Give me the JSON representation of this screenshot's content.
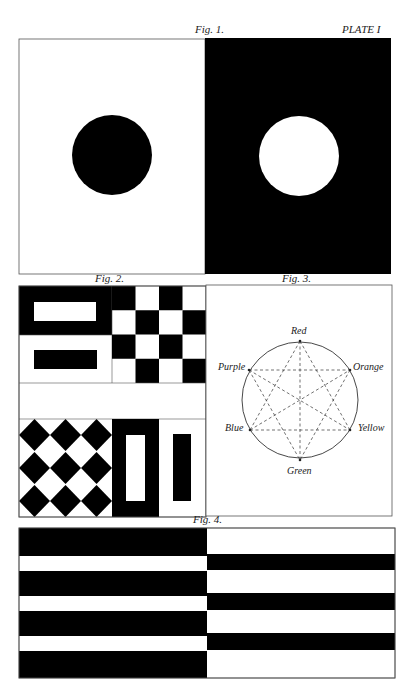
{
  "plate": {
    "title": "PLATE I",
    "colors": {
      "ink": "#000000",
      "paper": "#ffffff",
      "frame": "#555555",
      "dash": "#333333"
    }
  },
  "figures": [
    {
      "id": "fig1",
      "caption": "Fig. 1.",
      "description": "Black disc on white field beside white disc on black field",
      "panels": [
        {
          "background": "white",
          "disc": "black"
        },
        {
          "background": "black",
          "disc": "white"
        }
      ]
    },
    {
      "id": "fig2",
      "caption": "Fig. 2.",
      "description": "Figure-ground reversals: bars, checkerboard, diamonds, vertical bars",
      "panels": [
        {
          "name": "white-bar-on-black"
        },
        {
          "name": "black-bar-on-white"
        },
        {
          "name": "checkerboard",
          "rows": 4,
          "cols": 4
        },
        {
          "name": "diamond-pattern",
          "rows": 3,
          "cols": 3
        },
        {
          "name": "white-vertical-bar-on-black"
        },
        {
          "name": "black-vertical-bar-on-white"
        }
      ]
    },
    {
      "id": "fig3",
      "caption": "Fig. 3.",
      "description": "Color circle with complementary connections",
      "colors": [
        {
          "name": "Red",
          "position": "top"
        },
        {
          "name": "Orange",
          "position": "upper-right"
        },
        {
          "name": "Yellow",
          "position": "lower-right"
        },
        {
          "name": "Green",
          "position": "bottom"
        },
        {
          "name": "Blue",
          "position": "lower-left"
        },
        {
          "name": "Purple",
          "position": "upper-left"
        }
      ],
      "connections": [
        [
          "Red",
          "Blue"
        ],
        [
          "Red",
          "Yellow"
        ],
        [
          "Red",
          "Green"
        ],
        [
          "Purple",
          "Orange"
        ],
        [
          "Purple",
          "Yellow"
        ],
        [
          "Purple",
          "Green"
        ],
        [
          "Blue",
          "Yellow"
        ],
        [
          "Blue",
          "Orange"
        ],
        [
          "Orange",
          "Green"
        ]
      ]
    },
    {
      "id": "fig4",
      "caption": "Fig. 4.",
      "description": "Horizontal stripes: left wide black bands, right wide white bands",
      "left_bands": [
        "black",
        "white",
        "black",
        "white",
        "black",
        "white",
        "black"
      ],
      "right_bands": [
        "white",
        "black",
        "white",
        "black",
        "white",
        "black",
        "white"
      ]
    }
  ]
}
